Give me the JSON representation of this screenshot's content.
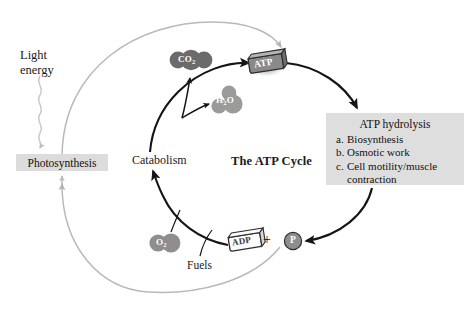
{
  "figure": {
    "title": "The ATP Cycle",
    "background_color": "#ffffff"
  },
  "labels": {
    "light_energy": "Light energy",
    "photosynthesis": "Photosynthesis",
    "catabolism": "Catabolism",
    "fuels": "Fuels",
    "plus": "+",
    "cycle_title": "The ATP Cycle"
  },
  "molecules": [
    {
      "id": "co2",
      "formula": "CO",
      "subscript": "2",
      "color": "#6b6b6b"
    },
    {
      "id": "h2o",
      "formula": "H",
      "subscript": "2",
      "suffix": "O",
      "color": "#9b9b9b"
    },
    {
      "id": "o2",
      "formula": "O",
      "subscript": "2",
      "color": "#8e8e8e"
    },
    {
      "id": "atp",
      "formula": "ATP",
      "color": "#8a8a8a"
    },
    {
      "id": "adp",
      "formula": "ADP",
      "color": "#ffffff"
    },
    {
      "id": "pi",
      "formula": "P",
      "color": "#8e8e8e"
    }
  ],
  "panel": {
    "title": "ATP hydrolysis",
    "items": [
      {
        "marker": "a.",
        "text": "Biosynthesis"
      },
      {
        "marker": "b.",
        "text": "Osmotic work"
      },
      {
        "marker": "c.",
        "text": "Cell motility/muscle contraction"
      }
    ],
    "background_color": "#dedede"
  },
  "photosynthesis_box": {
    "background_color": "#dcdcdc"
  },
  "colors": {
    "light_arc": "#b9b9b9",
    "dark_arc": "#151515",
    "text": "#1a1a1a"
  }
}
